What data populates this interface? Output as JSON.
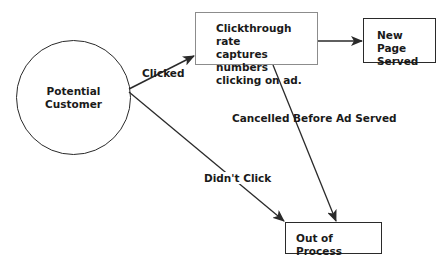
{
  "diagram": {
    "nodes": {
      "potential_customer": {
        "lines": [
          "Potential",
          "Customer"
        ],
        "shape": "circle"
      },
      "clickthrough": {
        "lines": [
          "Clickthrough rate",
          "captures numbers",
          "clicking on ad."
        ],
        "shape": "box"
      },
      "new_page": {
        "lines": [
          "New Page",
          "Served"
        ],
        "shape": "box"
      },
      "out_of_process": {
        "lines": [
          "Out of Process"
        ],
        "shape": "box"
      }
    },
    "edges": [
      {
        "from": "potential_customer",
        "to": "clickthrough",
        "label": "Clicked"
      },
      {
        "from": "clickthrough",
        "to": "new_page",
        "label": ""
      },
      {
        "from": "clickthrough",
        "to": "out_of_process",
        "label": "Cancelled Before Ad Served"
      },
      {
        "from": "potential_customer",
        "to": "out_of_process",
        "label": "Didn't Click"
      }
    ],
    "colors": {
      "stroke": "#2a2a2a",
      "box_border_gray": "#8c8c8c",
      "text": "#1a1a1a"
    }
  }
}
